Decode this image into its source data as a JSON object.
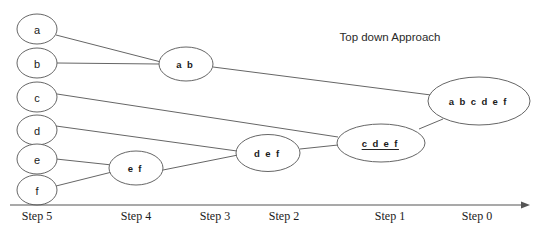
{
  "title": {
    "text": "Top down Approach",
    "x": 390,
    "y": 37
  },
  "colors": {
    "stroke": "#666666",
    "text": "#1a1a1a",
    "axis": "#555555",
    "background": "#ffffff"
  },
  "chart_data": {
    "type": "diagram",
    "subtype": "dendrogram",
    "title": "Top down Approach",
    "orientation": "horizontal-right-to-left",
    "xlabel": "",
    "ylabel": "",
    "axis": {
      "ticks": [
        "Step 5",
        "Step 4",
        "Step 3",
        "Step 2",
        "Step 1",
        "Step 0"
      ],
      "tick_x": [
        37,
        136,
        215,
        284,
        390,
        477
      ],
      "line_y": 205,
      "line_x_start": 10,
      "line_x_end": 530,
      "arrow": "right"
    },
    "nodes": [
      {
        "id": "a",
        "label": "a",
        "cx": 37,
        "cy": 29,
        "rx": 20,
        "ry": 15,
        "kind": "leaf",
        "step": 5,
        "underline": false
      },
      {
        "id": "b",
        "label": "b",
        "cx": 37,
        "cy": 63,
        "rx": 20,
        "ry": 15,
        "kind": "leaf",
        "step": 5,
        "underline": false
      },
      {
        "id": "c",
        "label": "c",
        "cx": 37,
        "cy": 97,
        "rx": 20,
        "ry": 15,
        "kind": "leaf",
        "step": 5,
        "underline": false
      },
      {
        "id": "d",
        "label": "d",
        "cx": 37,
        "cy": 130,
        "rx": 20,
        "ry": 15,
        "kind": "leaf",
        "step": 5,
        "underline": false
      },
      {
        "id": "e",
        "label": "e",
        "cx": 37,
        "cy": 159,
        "rx": 20,
        "ry": 15,
        "kind": "leaf",
        "step": 5,
        "underline": false
      },
      {
        "id": "f",
        "label": "f",
        "cx": 37,
        "cy": 190,
        "rx": 20,
        "ry": 15,
        "kind": "leaf",
        "step": 5,
        "underline": false
      },
      {
        "id": "ef",
        "label": "e f",
        "cx": 136,
        "cy": 168,
        "rx": 27,
        "ry": 17,
        "kind": "cluster",
        "step": 4,
        "underline": false
      },
      {
        "id": "ab",
        "label": "a b",
        "cx": 186,
        "cy": 64,
        "rx": 27,
        "ry": 17,
        "kind": "cluster",
        "step": 3,
        "underline": false
      },
      {
        "id": "def",
        "label": "d e f",
        "cx": 268,
        "cy": 153,
        "rx": 32,
        "ry": 18.5,
        "kind": "cluster",
        "step": 2,
        "underline": false
      },
      {
        "id": "cdef",
        "label": "c d e f",
        "cx": 381,
        "cy": 143,
        "rx": 44,
        "ry": 19,
        "kind": "cluster",
        "step": 1,
        "underline": true
      },
      {
        "id": "abcdef",
        "label": "a b c d e f",
        "cx": 479,
        "cy": 101,
        "rx": 51,
        "ry": 24,
        "kind": "cluster",
        "step": 0,
        "underline": false
      }
    ],
    "edges": [
      {
        "from": "a",
        "to": "ab",
        "x1": 56,
        "y1": 35,
        "x2": 161,
        "y2": 62
      },
      {
        "from": "b",
        "to": "ab",
        "x1": 57,
        "y1": 63,
        "x2": 159,
        "y2": 64
      },
      {
        "from": "c",
        "to": "cdef",
        "x1": 57,
        "y1": 94,
        "x2": 338,
        "y2": 137
      },
      {
        "from": "d",
        "to": "def",
        "x1": 56,
        "y1": 126,
        "x2": 237,
        "y2": 151
      },
      {
        "from": "e",
        "to": "ef",
        "x1": 56,
        "y1": 159,
        "x2": 112,
        "y2": 165
      },
      {
        "from": "f",
        "to": "ef",
        "x1": 56,
        "y1": 186,
        "x2": 112,
        "y2": 172
      },
      {
        "from": "ef",
        "to": "def",
        "x1": 163,
        "y1": 170,
        "x2": 238,
        "y2": 155
      },
      {
        "from": "def",
        "to": "cdef",
        "x1": 300,
        "y1": 149,
        "x2": 338,
        "y2": 145
      },
      {
        "from": "cdef",
        "to": "abcdef",
        "x1": 419,
        "y1": 129,
        "x2": 443,
        "y2": 119
      },
      {
        "from": "ab",
        "to": "abcdef",
        "x1": 213,
        "y1": 67,
        "x2": 431,
        "y2": 95
      }
    ]
  }
}
